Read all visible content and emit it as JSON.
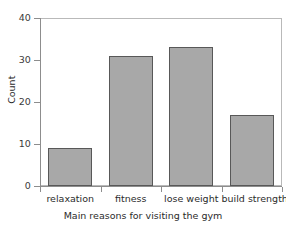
{
  "chart_data": {
    "type": "bar",
    "title": "",
    "subtitle": "",
    "categories": [
      "relaxation",
      "fitness",
      "lose weight",
      "build strength"
    ],
    "values": [
      9,
      31,
      33,
      17
    ],
    "xlabel": "Main reasons for visiting the gym",
    "ylabel": "Count",
    "ylim": [
      0,
      40
    ],
    "yticks": [
      0,
      10,
      20,
      30,
      40
    ],
    "ytick_labels": [
      "0",
      "10",
      "20",
      "30",
      "40"
    ],
    "grid": false,
    "legend": false,
    "legend_position": "none",
    "annotations": []
  },
  "style": {
    "bar_fill": "#a8a8a8",
    "bar_border": "#585858",
    "axis_color": "#8d8d8d",
    "frame_color": "#b9b9b9",
    "text_color": "#2b2b2b",
    "background": "#ffffff"
  },
  "axis": {
    "y_title": "Count",
    "x_title": "Main reasons for visiting the gym",
    "y_labels": [
      "40",
      "30",
      "20",
      "10",
      "0"
    ]
  }
}
